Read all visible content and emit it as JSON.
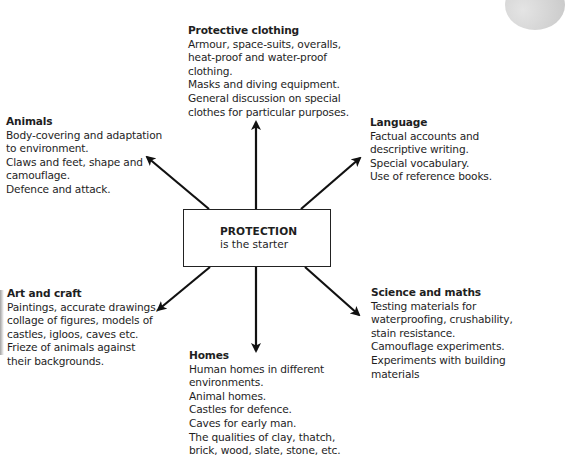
{
  "center": {
    "title": "PROTECTION",
    "subtitle": "is the starter"
  },
  "topics": {
    "protective_clothing": {
      "title": "Protective clothing",
      "lines": [
        "Armour, space-suits, overalls,",
        "heat-proof and water-proof",
        "clothing.",
        "Masks and diving equipment.",
        "General discussion on special",
        "clothes for particular purposes."
      ]
    },
    "animals": {
      "title": "Animals",
      "lines": [
        "Body-covering and adaptation",
        "to environment.",
        "Claws and feet, shape and",
        "camouflage.",
        "Defence and attack."
      ]
    },
    "language": {
      "title": "Language",
      "lines": [
        "Factual accounts and",
        "descriptive writing.",
        "Special vocabulary.",
        "Use of reference books."
      ]
    },
    "art_and_craft": {
      "title": "Art and craft",
      "lines": [
        "Paintings, accurate drawings,",
        "collage of figures, models of",
        "castles, igloos, caves etc.",
        "Frieze of animals against",
        "their backgrounds."
      ]
    },
    "science_and_maths": {
      "title": "Science and maths",
      "lines": [
        "Testing materials for",
        "waterproofing, crushability,",
        "stain resistance.",
        "Camouflage experiments.",
        "Experiments with building",
        "materials"
      ]
    },
    "homes": {
      "title": "Homes",
      "lines": [
        "Human homes in different",
        "environments.",
        "Animal homes.",
        "Castles for defence.",
        "Caves for early man.",
        "The qualities of clay, thatch,",
        "brick, wood, slate, stone, etc."
      ]
    }
  },
  "colors": {
    "ink": "#1e1e1e",
    "background": "#ffffff",
    "arrow": "#111111"
  }
}
